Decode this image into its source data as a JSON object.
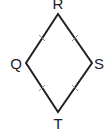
{
  "diagram": {
    "shape": "rhombus",
    "vertices": [
      {
        "name": "R",
        "x": 58,
        "y": 14,
        "label_x": 58,
        "label_y": 9
      },
      {
        "name": "S",
        "x": 92,
        "y": 63,
        "label_x": 99,
        "label_y": 69
      },
      {
        "name": "T",
        "x": 58,
        "y": 112,
        "label_x": 58,
        "label_y": 130
      },
      {
        "name": "Q",
        "x": 26,
        "y": 63,
        "label_x": 16,
        "label_y": 69
      }
    ],
    "labels": {
      "R": "R",
      "S": "S",
      "T": "T",
      "Q": "Q"
    },
    "tick_marks": "one tick on each side (all sides congruent)",
    "stroke_color": "#222222",
    "tick_color": "#888888"
  }
}
